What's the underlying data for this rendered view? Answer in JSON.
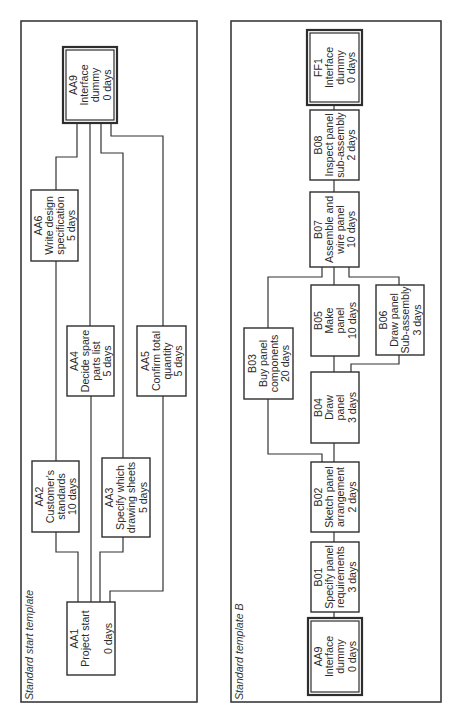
{
  "panels": [
    {
      "id": "start",
      "title": "Standard start template",
      "frame": {
        "x": 21,
        "y": 21,
        "w": 176,
        "h": 681
      },
      "title_pos": {
        "x": 33,
        "y": 700
      },
      "nodes": [
        {
          "id": "AA9",
          "lines": [
            "AA9",
            "Interface",
            "dummy",
            "0 days"
          ],
          "x": 63,
          "y": 47,
          "w": 54,
          "h": 76,
          "double": true
        },
        {
          "id": "AA6",
          "lines": [
            "AA6",
            "Write design",
            "specification",
            "5 days"
          ],
          "x": 31,
          "y": 190,
          "w": 47,
          "h": 71,
          "double": false
        },
        {
          "id": "AA4",
          "lines": [
            "AA4",
            "Decide spare",
            "parts list",
            "5 days"
          ],
          "x": 67,
          "y": 326,
          "w": 47,
          "h": 70,
          "double": false
        },
        {
          "id": "AA5",
          "lines": [
            "AA5",
            "Confirm total",
            "quantity",
            "5 days"
          ],
          "x": 137,
          "y": 326,
          "w": 49,
          "h": 70,
          "double": false
        },
        {
          "id": "AA2",
          "lines": [
            "AA2",
            "Customer's",
            "standards",
            "10 days"
          ],
          "x": 32,
          "y": 461,
          "w": 47,
          "h": 71,
          "double": false
        },
        {
          "id": "AA3",
          "lines": [
            "AA3",
            "Specify which",
            "drawing sheets",
            "5 days"
          ],
          "x": 102,
          "y": 458,
          "w": 48,
          "h": 79,
          "double": false
        },
        {
          "id": "AA1",
          "lines": [
            "AA1",
            "Project start",
            "",
            "0 days"
          ],
          "x": 67,
          "y": 602,
          "w": 48,
          "h": 73,
          "double": false
        }
      ],
      "links": [
        {
          "from": "AA9",
          "to": "AA6",
          "points": [
            [
              77,
              123
            ],
            [
              77,
              157
            ],
            [
              56,
              157
            ],
            [
              56,
              190
            ]
          ]
        },
        {
          "from": "AA9",
          "to": "AA4",
          "points": [
            [
              90,
              123
            ],
            [
              90,
              326
            ]
          ]
        },
        {
          "from": "AA9",
          "to": "AA3",
          "points": [
            [
              101,
              123
            ],
            [
              101,
              153
            ],
            [
              123,
              153
            ],
            [
              123,
              458
            ]
          ]
        },
        {
          "from": "AA9",
          "to": "AA5",
          "points": [
            [
              111,
              123
            ],
            [
              111,
              136
            ],
            [
              163,
              136
            ],
            [
              163,
              326
            ]
          ]
        },
        {
          "from": "AA6",
          "to": "AA2",
          "points": [
            [
              56,
              261
            ],
            [
              56,
              461
            ]
          ]
        },
        {
          "from": "AA2",
          "to": "AA1",
          "points": [
            [
              56,
              532
            ],
            [
              56,
              552
            ],
            [
              78,
              552
            ],
            [
              78,
              602
            ]
          ]
        },
        {
          "from": "AA4",
          "to": "AA1",
          "points": [
            [
              91,
              396
            ],
            [
              91,
              602
            ]
          ]
        },
        {
          "from": "AA3",
          "to": "AA1",
          "points": [
            [
              123,
              537
            ],
            [
              123,
              552
            ],
            [
              100,
              552
            ],
            [
              100,
              602
            ]
          ]
        },
        {
          "from": "AA5",
          "to": "AA1",
          "points": [
            [
              163,
              396
            ],
            [
              163,
              591
            ],
            [
              110,
              591
            ],
            [
              110,
              602
            ]
          ]
        }
      ]
    },
    {
      "id": "B",
      "title": "Standard template B",
      "frame": {
        "x": 231,
        "y": 21,
        "w": 210,
        "h": 681
      },
      "title_pos": {
        "x": 243,
        "y": 700
      },
      "nodes": [
        {
          "id": "FF1",
          "lines": [
            "FF1",
            "Interface",
            "dummy",
            "0 days"
          ],
          "x": 307,
          "y": 30,
          "w": 55,
          "h": 75,
          "double": true
        },
        {
          "id": "B08",
          "lines": [
            "B08",
            "Inspect panel",
            "sub-assembly",
            "2 days"
          ],
          "x": 310,
          "y": 110,
          "w": 49,
          "h": 70,
          "double": false
        },
        {
          "id": "B07",
          "lines": [
            "B07",
            "Assemble and",
            "wire panel",
            "10 days"
          ],
          "x": 310,
          "y": 192,
          "w": 49,
          "h": 75,
          "double": false
        },
        {
          "id": "B03",
          "lines": [
            "B03",
            "Buy panel",
            "components",
            "20 days"
          ],
          "x": 244,
          "y": 328,
          "w": 49,
          "h": 71,
          "double": false
        },
        {
          "id": "B05",
          "lines": [
            "B05",
            "Make",
            "panel",
            "10 days"
          ],
          "x": 311,
          "y": 285,
          "w": 48,
          "h": 71,
          "double": false
        },
        {
          "id": "B06",
          "lines": [
            "B06",
            "Draw panel",
            "Sub-assembly",
            "3 days"
          ],
          "x": 376,
          "y": 285,
          "w": 48,
          "h": 70,
          "double": false
        },
        {
          "id": "B04",
          "lines": [
            "B04",
            "Draw",
            "panel",
            "3 days"
          ],
          "x": 311,
          "y": 372,
          "w": 48,
          "h": 71,
          "double": false
        },
        {
          "id": "B02",
          "lines": [
            "B02",
            "Sketch panel",
            "arrangement",
            "2 days"
          ],
          "x": 311,
          "y": 462,
          "w": 48,
          "h": 70,
          "double": false
        },
        {
          "id": "B01",
          "lines": [
            "B01",
            "Specify panel",
            "requirements",
            "3 days"
          ],
          "x": 311,
          "y": 542,
          "w": 48,
          "h": 70,
          "double": false
        },
        {
          "id": "AA9",
          "lines": [
            "AA9",
            "Interface",
            "dummy",
            "0 days"
          ],
          "x": 308,
          "y": 618,
          "w": 54,
          "h": 77,
          "double": true
        }
      ],
      "links": [
        {
          "from": "FF1",
          "to": "B08",
          "points": [
            [
              334,
              105
            ],
            [
              334,
              110
            ]
          ]
        },
        {
          "from": "B08",
          "to": "B07",
          "points": [
            [
              334,
              180
            ],
            [
              334,
              192
            ]
          ]
        },
        {
          "from": "B07",
          "to": "B03",
          "points": [
            [
              322,
              267
            ],
            [
              322,
              277
            ],
            [
              268,
              277
            ],
            [
              268,
              328
            ]
          ]
        },
        {
          "from": "B07",
          "to": "B05",
          "points": [
            [
              334,
              267
            ],
            [
              334,
              285
            ]
          ]
        },
        {
          "from": "B07",
          "to": "B06",
          "points": [
            [
              349,
              267
            ],
            [
              349,
              277
            ],
            [
              399,
              277
            ],
            [
              399,
              285
            ]
          ]
        },
        {
          "from": "B05",
          "to": "B04",
          "points": [
            [
              334,
              356
            ],
            [
              334,
              372
            ]
          ]
        },
        {
          "from": "B06",
          "to": "B04",
          "points": [
            [
              399,
              355
            ],
            [
              399,
              364
            ],
            [
              351,
              364
            ],
            [
              351,
              372
            ]
          ]
        },
        {
          "from": "B03",
          "to": "B02",
          "points": [
            [
              268,
              399
            ],
            [
              268,
              454
            ],
            [
              322,
              454
            ],
            [
              322,
              462
            ]
          ]
        },
        {
          "from": "B04",
          "to": "B02",
          "points": [
            [
              334,
              443
            ],
            [
              334,
              462
            ]
          ]
        },
        {
          "from": "B02",
          "to": "B01",
          "points": [
            [
              334,
              532
            ],
            [
              334,
              542
            ]
          ]
        },
        {
          "from": "B01",
          "to": "AA9",
          "points": [
            [
              334,
              612
            ],
            [
              334,
              618
            ]
          ]
        }
      ]
    }
  ]
}
